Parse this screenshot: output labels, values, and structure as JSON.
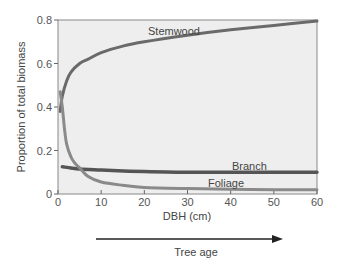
{
  "chart_data": {
    "type": "line",
    "title": "",
    "xlabel": "DBH (cm)",
    "ylabel": "Proportion of total biomass",
    "xlim": [
      0,
      60
    ],
    "ylim": [
      0,
      0.8
    ],
    "xticks": [
      0,
      10,
      20,
      30,
      40,
      50,
      60
    ],
    "yticks": [
      0,
      0.2,
      0.4,
      0.6,
      0.8
    ],
    "xtick_labels": [
      "0",
      "10",
      "20",
      "30",
      "40",
      "50",
      "60"
    ],
    "ytick_labels": [
      "0",
      "0.2",
      "0.4",
      "0.6",
      "0.8"
    ],
    "grid": false,
    "legend": "inline labels",
    "annotation": {
      "arrow_label": "Tree age",
      "direction": "increasing with DBH"
    },
    "series": [
      {
        "name": "Stemwood",
        "color": "#6a6a6a",
        "x": [
          0.5,
          1,
          2,
          3,
          5,
          7,
          10,
          15,
          20,
          30,
          40,
          50,
          60
        ],
        "values": [
          0.38,
          0.45,
          0.52,
          0.56,
          0.6,
          0.62,
          0.65,
          0.68,
          0.7,
          0.73,
          0.755,
          0.775,
          0.795
        ]
      },
      {
        "name": "Branch",
        "color": "#555555",
        "x": [
          1,
          3,
          5,
          10,
          20,
          30,
          40,
          50,
          60
        ],
        "values": [
          0.125,
          0.12,
          0.115,
          0.11,
          0.103,
          0.1,
          0.1,
          0.1,
          0.1
        ]
      },
      {
        "name": "Foliage",
        "color": "#8a8a8a",
        "x": [
          0.5,
          1,
          1.5,
          2,
          3,
          4,
          5,
          7,
          10,
          15,
          20,
          30,
          40,
          50,
          60
        ],
        "values": [
          0.47,
          0.4,
          0.3,
          0.23,
          0.17,
          0.14,
          0.12,
          0.08,
          0.055,
          0.04,
          0.03,
          0.025,
          0.022,
          0.02,
          0.02
        ]
      }
    ]
  },
  "labels": {
    "ylabel": "Proportion of total biomass",
    "xlabel": "DBH (cm)",
    "arrow": "Tree age",
    "stemwood": "Stemwood",
    "branch": "Branch",
    "foliage": "Foliage"
  }
}
